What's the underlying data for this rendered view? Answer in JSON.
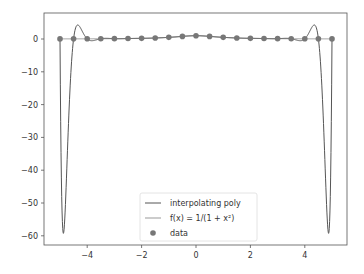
{
  "chart_data": {
    "type": "line",
    "title": "",
    "xlabel": "",
    "ylabel": "",
    "xlim": [
      -5.5,
      5.6
    ],
    "ylim": [
      -63,
      7
    ],
    "grid": false,
    "legend_position": "lower center",
    "x_ticks": [
      -4,
      -2,
      0,
      2,
      4
    ],
    "x_tick_labels": [
      "−4",
      "−2",
      "0",
      "2",
      "4"
    ],
    "y_ticks": [
      0,
      -10,
      -20,
      -30,
      -40,
      -50,
      -60
    ],
    "y_tick_labels": [
      "0",
      "−10",
      "−20",
      "−30",
      "−40",
      "−50",
      "−60"
    ],
    "series": [
      {
        "name": "interpolating poly",
        "kind": "line",
        "color": "#555555"
      },
      {
        "name": "f(x) = 1/(1 + x²)",
        "kind": "line",
        "color": "#999999"
      },
      {
        "name": "data",
        "kind": "scatter",
        "color": "#777777",
        "x": [
          -5,
          -4.5,
          -4,
          -3.5,
          -3,
          -2.5,
          -2,
          -1.5,
          -1,
          -0.5,
          0,
          0.5,
          1,
          1.5,
          2,
          2.5,
          3,
          3.5,
          4,
          4.5,
          5
        ],
        "y": [
          0.038,
          0.047,
          0.059,
          0.075,
          0.1,
          0.138,
          0.2,
          0.308,
          0.5,
          0.8,
          1.0,
          0.8,
          0.5,
          0.308,
          0.2,
          0.138,
          0.1,
          0.075,
          0.059,
          0.047,
          0.038
        ]
      }
    ],
    "annotations": {
      "poly_min_near_x": [
        -4.8,
        4.8
      ],
      "poly_min_value": -59.8,
      "poly_local_max_near_x": [
        -4.2,
        4.2
      ],
      "poly_local_max_value": 4.2
    }
  },
  "legend": {
    "items": [
      {
        "label": "interpolating poly"
      },
      {
        "label": "f(x) = 1/(1 + x²)"
      },
      {
        "label": "data"
      }
    ]
  }
}
